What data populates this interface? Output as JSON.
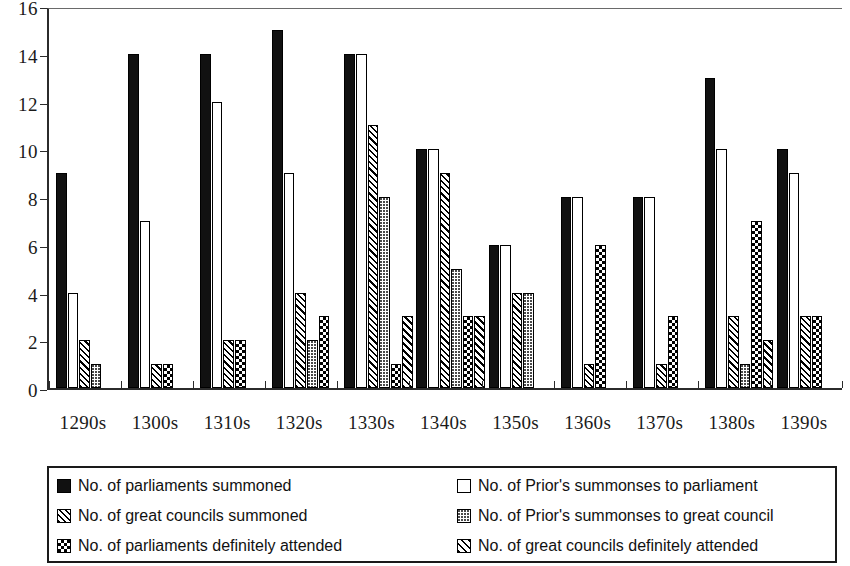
{
  "chart_data": {
    "type": "bar",
    "title": "",
    "subtitle": "",
    "xlabel": "",
    "ylabel": "",
    "ylim": [
      0,
      16
    ],
    "y_ticks": [
      0,
      2,
      4,
      6,
      8,
      10,
      12,
      14,
      16
    ],
    "grid": false,
    "legend_position": "below",
    "categories": [
      "1290s",
      "1300s",
      "1310s",
      "1320s",
      "1330s",
      "1340s",
      "1350s",
      "1360s",
      "1370s",
      "1380s",
      "1390s"
    ],
    "series": [
      {
        "name": "No. of parliaments summoned",
        "pattern": "solid-black",
        "values": [
          9,
          14,
          14,
          15,
          14,
          10,
          6,
          8,
          8,
          13,
          10
        ]
      },
      {
        "name": "No. of Prior's summonses to parliament",
        "pattern": "open-white",
        "values": [
          4,
          7,
          12,
          9,
          14,
          10,
          6,
          8,
          8,
          10,
          9
        ]
      },
      {
        "name": "No. of  great councils summoned",
        "pattern": "diagonal-hatch",
        "values": [
          2,
          1,
          2,
          4,
          11,
          9,
          4,
          1,
          1,
          3,
          3
        ]
      },
      {
        "name": "No. of Prior's summonses to great council",
        "pattern": "light-dots",
        "values": [
          1,
          0,
          0,
          2,
          8,
          5,
          4,
          0,
          0,
          1,
          0
        ]
      },
      {
        "name": "No. of parliaments definitely attended",
        "pattern": "checkerboard",
        "values": [
          0,
          1,
          2,
          3,
          1,
          3,
          0,
          6,
          3,
          7,
          3
        ]
      },
      {
        "name": "No. of  great councils definitely attended",
        "pattern": "diagonal-hatch-bold",
        "values": [
          0,
          0,
          0,
          0,
          3,
          3,
          0,
          0,
          0,
          2,
          0
        ]
      }
    ]
  },
  "legend": {
    "items": [
      {
        "label": "No. of parliaments summoned",
        "pattern": "solid-black"
      },
      {
        "label": "No. of Prior's summonses to parliament",
        "pattern": "open-white"
      },
      {
        "label": "No. of  great councils summoned",
        "pattern": "diagonal-hatch"
      },
      {
        "label": "No. of Prior's summonses to great council",
        "pattern": "light-dots"
      },
      {
        "label": "No. of parliaments definitely attended",
        "pattern": "checkerboard"
      },
      {
        "label": "No. of  great councils definitely attended",
        "pattern": "diagonal-hatch-bold"
      }
    ]
  }
}
